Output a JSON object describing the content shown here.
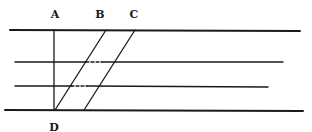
{
  "diagram": {
    "labels": {
      "a": "A",
      "b": "B",
      "c": "C",
      "d": "D"
    },
    "stroke_color": "#1a1a1a",
    "background": "#ffffff"
  }
}
